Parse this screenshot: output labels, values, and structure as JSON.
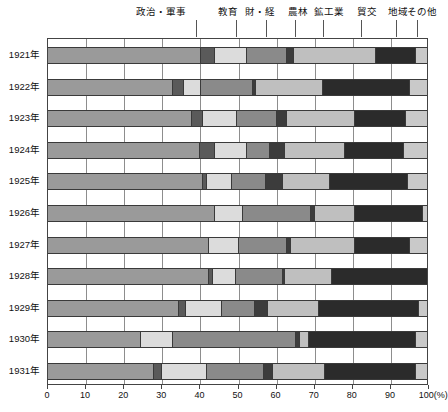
{
  "chart_data": {
    "type": "bar",
    "orientation": "horizontal",
    "stacked": true,
    "title": "",
    "subtitle": "",
    "xlabel": "(%)",
    "ylabel": "",
    "xlim": [
      0,
      100
    ],
    "grid": true,
    "legend_position": "top",
    "xticks": [
      "0",
      "10",
      "20",
      "30",
      "40",
      "50",
      "60",
      "70",
      "80",
      "90",
      "100"
    ],
    "xunit": "(%)",
    "categories": [
      "1921年",
      "1922年",
      "1923年",
      "1924年",
      "1925年",
      "1926年",
      "1927年",
      "1928年",
      "1929年",
      "1930年",
      "1931年"
    ],
    "series": [
      {
        "name": "政治・軍事",
        "color": "#9a9a9a",
        "label_x": 30.0,
        "leader_x": 39.0,
        "values": [
          40.5,
          33.0,
          38.0,
          40.0,
          41.0,
          44.0,
          42.5,
          42.5,
          34.5,
          24.5,
          28.0
        ]
      },
      {
        "name": "教育",
        "color": "#5a5a5a",
        "label_x": 47.5,
        "leader_x": 49.5,
        "values": [
          3.5,
          3.0,
          3.0,
          4.0,
          1.0,
          0.0,
          0.0,
          1.0,
          2.0,
          0.0,
          2.0
        ]
      },
      {
        "name": "財・経",
        "color": "#dcdcdc",
        "label_x": 56.0,
        "leader_x": 57.5,
        "values": [
          8.5,
          4.5,
          9.0,
          8.5,
          6.5,
          7.5,
          8.0,
          6.0,
          9.5,
          8.5,
          12.0
        ]
      },
      {
        "name": "農林",
        "color": "#8a8a8a",
        "label_x": 66.0,
        "leader_x": 65.0,
        "values": [
          10.5,
          13.5,
          10.5,
          6.0,
          9.0,
          18.0,
          12.5,
          12.5,
          8.5,
          32.5,
          15.0
        ]
      },
      {
        "name": "鉱工業",
        "color": "#3c3c3c",
        "label_x": 74.0,
        "leader_x": 72.5,
        "values": [
          2.0,
          1.0,
          2.5,
          4.0,
          4.5,
          1.0,
          1.0,
          0.5,
          3.5,
          1.0,
          2.5
        ]
      },
      {
        "name": "貿交",
        "color": "#bfbfbf",
        "label_x": 84.0,
        "leader_x": 82.5,
        "values": [
          21.5,
          17.5,
          18.0,
          16.0,
          12.5,
          10.5,
          17.0,
          12.5,
          13.5,
          2.5,
          13.5
        ]
      },
      {
        "name": "地域",
        "color": "#2b2b2b",
        "label_x": 92.0,
        "leader_x": 91.5,
        "values": [
          10.5,
          23.0,
          13.5,
          15.5,
          20.5,
          18.0,
          14.5,
          25.0,
          26.5,
          28.0,
          24.0
        ]
      },
      {
        "name": "その他",
        "color": "#c9c9c9",
        "label_x": 98.5,
        "leader_x": 97.0,
        "values": [
          3.0,
          4.5,
          5.5,
          6.0,
          5.0,
          1.0,
          4.5,
          0.0,
          2.0,
          3.0,
          3.0
        ]
      }
    ]
  }
}
